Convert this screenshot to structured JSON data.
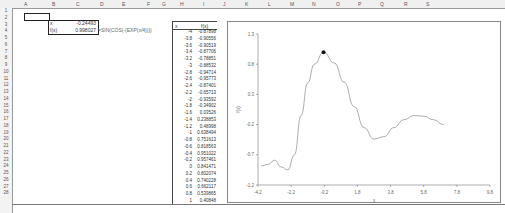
{
  "spreadsheet": {
    "columns": [
      "A",
      "B",
      "C",
      "D",
      "E",
      "F",
      "G",
      "H",
      "I",
      "J",
      "K",
      "L",
      "M",
      "N",
      "O",
      "P",
      "Q",
      "R",
      "S"
    ],
    "rows": [
      "1",
      "2",
      "3",
      "4",
      "5",
      "6",
      "7",
      "8",
      "9",
      "10",
      "11",
      "12",
      "13",
      "14",
      "15",
      "16",
      "17",
      "18",
      "19",
      "20",
      "21",
      "22",
      "23",
      "24",
      "25",
      "26",
      "27",
      "28"
    ],
    "cells": {
      "B2": "x",
      "C2": "-0.24493",
      "B3": "f(x)",
      "C3": "0.998027",
      "D3": "=SIN(COS(-(EXP(x/4))))"
    },
    "table": {
      "header_x": "x",
      "header_fx": "f(x)",
      "rows": [
        {
          "x": "-4",
          "fx": "-0.87898"
        },
        {
          "x": "-3.8",
          "fx": "-0.90556"
        },
        {
          "x": "-3.6",
          "fx": "-0.90519"
        },
        {
          "x": "-3.4",
          "fx": "-0.87706"
        },
        {
          "x": "-3.2",
          "fx": "-0.78851"
        },
        {
          "x": "-3",
          "fx": "-0.88532"
        },
        {
          "x": "-2.8",
          "fx": "-0.94714"
        },
        {
          "x": "-2.6",
          "fx": "-0.95773"
        },
        {
          "x": "-2.4",
          "fx": "-0.87401"
        },
        {
          "x": "-2.2",
          "fx": "-0.65713"
        },
        {
          "x": "-2",
          "fx": "-0.93592"
        },
        {
          "x": "-1.8",
          "fx": "-0.34902"
        },
        {
          "x": "-1.6",
          "fx": "0.03526"
        },
        {
          "x": "-1.4",
          "fx": "0.238853"
        },
        {
          "x": "-1.2",
          "fx": "0.48998"
        },
        {
          "x": "-1",
          "fx": "0.638494"
        },
        {
          "x": "-0.8",
          "fx": "0.751613"
        },
        {
          "x": "-0.6",
          "fx": "0.818563"
        },
        {
          "x": "-0.4",
          "fx": "0.951022"
        },
        {
          "x": "-0.2",
          "fx": "0.957461"
        },
        {
          "x": "0",
          "fx": "0.841471"
        },
        {
          "x": "0.2",
          "fx": "0.802074"
        },
        {
          "x": "0.4",
          "fx": "0.740228"
        },
        {
          "x": "0.6",
          "fx": "0.662117"
        },
        {
          "x": "0.8",
          "fx": "0.539865"
        },
        {
          "x": "1",
          "fx": "0.40848"
        }
      ]
    }
  },
  "chart_data": {
    "type": "line",
    "title": "",
    "xlabel": "x",
    "ylabel": "f(x)",
    "xlim": [
      -4.2,
      9.8
    ],
    "ylim": [
      -1.2,
      1.3
    ],
    "x_ticks": [
      "-4.2",
      "-2.2",
      "-0.2",
      "1.8",
      "3.8",
      "5.8",
      "7.8",
      "9.8"
    ],
    "y_ticks": [
      "1.3",
      "0.8",
      "0.3",
      "-0.2",
      "-0.7",
      "-1.2"
    ],
    "grid": false,
    "series": [
      {
        "name": "f(x)",
        "x": [
          -4,
          -3.6,
          -3.2,
          -2.8,
          -2.4,
          -2.0,
          -1.6,
          -1.2,
          -0.8,
          -0.24,
          0.4,
          1.0,
          1.6,
          2.2,
          2.8,
          3.4,
          4.0,
          4.6,
          5.2,
          5.8,
          6.4,
          7.0
        ],
        "values": [
          -0.88,
          -0.86,
          -0.79,
          -0.9,
          -0.95,
          -0.7,
          -0.05,
          0.49,
          0.8,
          0.998,
          0.82,
          0.5,
          0.1,
          -0.25,
          -0.44,
          -0.4,
          -0.25,
          -0.12,
          -0.05,
          -0.06,
          -0.12,
          -0.2
        ]
      }
    ],
    "highlight_point": {
      "x": -0.24493,
      "y": 0.998027
    }
  }
}
